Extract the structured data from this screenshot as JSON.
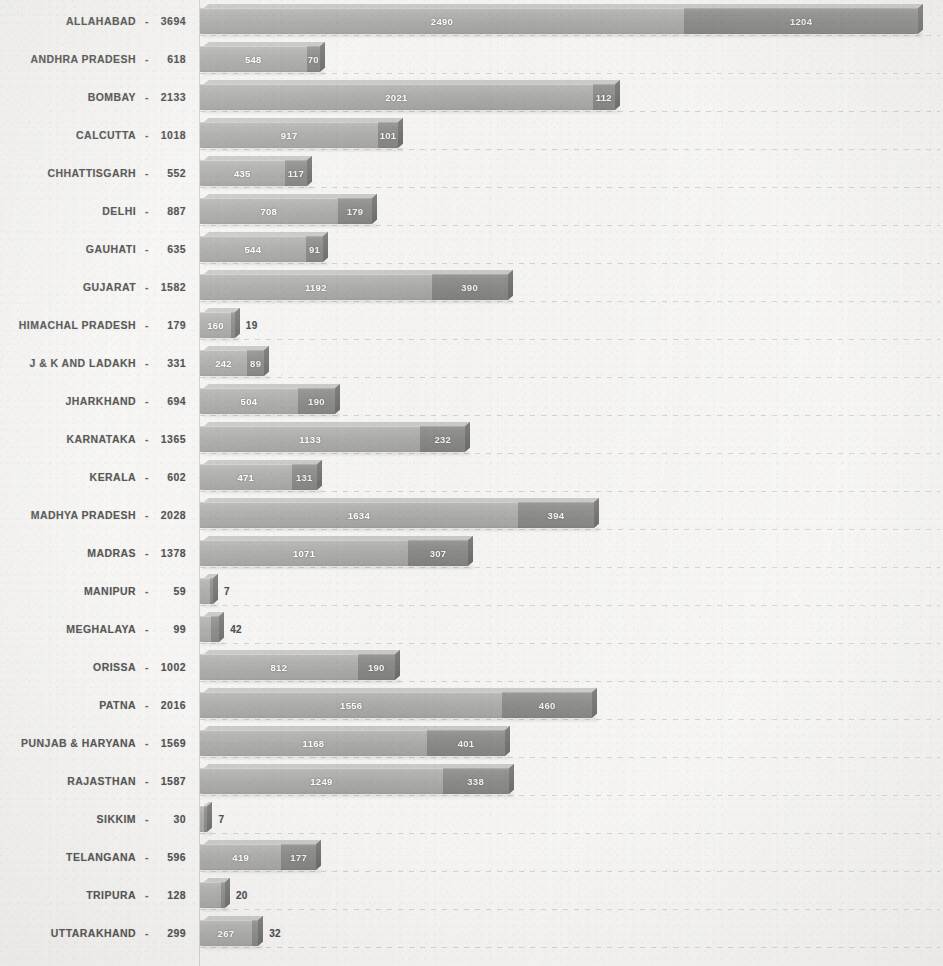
{
  "chart_data": {
    "type": "bar",
    "orientation": "horizontal",
    "stacked": true,
    "title": "",
    "subtitle": "",
    "xlabel": "",
    "ylabel": "",
    "grid": true,
    "legend": null,
    "xlim": [
      0,
      3800
    ],
    "x_axis_visible": false,
    "tick_labels": [],
    "series": [
      {
        "name": "segment-1",
        "color": "#a0a09e",
        "values": [
          2490,
          548,
          2021,
          917,
          435,
          708,
          544,
          1192,
          160,
          242,
          504,
          1133,
          471,
          1634,
          1071,
          52,
          57,
          812,
          1556,
          1168,
          1249,
          23,
          419,
          108,
          267
        ]
      },
      {
        "name": "segment-2",
        "color": "#7a7a78",
        "values": [
          1204,
          70,
          112,
          101,
          117,
          179,
          91,
          390,
          19,
          89,
          190,
          232,
          131,
          394,
          307,
          7,
          42,
          190,
          460,
          401,
          338,
          7,
          177,
          20,
          32
        ]
      }
    ],
    "categories": [
      "ALLAHABAD",
      "ANDHRA PRADESH",
      "BOMBAY",
      "CALCUTTA",
      "CHHATTISGARH",
      "DELHI",
      "GAUHATI",
      "GUJARAT",
      "HIMACHAL PRADESH",
      "J & K AND LADAKH",
      "JHARKHAND",
      "KARNATAKA",
      "KERALA",
      "MADHYA PRADESH",
      "MADRAS",
      "MANIPUR",
      "MEGHALAYA",
      "ORISSA",
      "PATNA",
      "PUNJAB & HARYANA",
      "RAJASTHAN",
      "SIKKIM",
      "TELANGANA",
      "TRIPURA",
      "UTTARAKHAND"
    ],
    "totals": [
      3694,
      618,
      2133,
      1018,
      552,
      887,
      635,
      1582,
      179,
      331,
      694,
      1365,
      602,
      2028,
      1378,
      59,
      99,
      1002,
      2016,
      1569,
      1587,
      30,
      596,
      128,
      299
    ]
  },
  "rows": [
    {
      "name": "ALLAHABAD",
      "separator": "-",
      "total": "3694",
      "v1": "2490",
      "v2": "1204",
      "n1": 2490,
      "n2": 1204,
      "inside2": true
    },
    {
      "name": "ANDHRA PRADESH",
      "separator": "-",
      "total": "618",
      "v1": "548",
      "v2": "70",
      "n1": 548,
      "n2": 70,
      "inside2": true
    },
    {
      "name": "BOMBAY",
      "separator": "-",
      "total": "2133",
      "v1": "2021",
      "v2": "112",
      "n1": 2021,
      "n2": 112,
      "inside2": true
    },
    {
      "name": "CALCUTTA",
      "separator": "-",
      "total": "1018",
      "v1": "917",
      "v2": "101",
      "n1": 917,
      "n2": 101,
      "inside2": true
    },
    {
      "name": "CHHATTISGARH",
      "separator": "-",
      "total": "552",
      "v1": "435",
      "v2": "117",
      "n1": 435,
      "n2": 117,
      "inside2": true
    },
    {
      "name": "DELHI",
      "separator": "-",
      "total": "887",
      "v1": "708",
      "v2": "179",
      "n1": 708,
      "n2": 179,
      "inside2": true
    },
    {
      "name": "GAUHATI",
      "separator": "-",
      "total": "635",
      "v1": "544",
      "v2": "91",
      "n1": 544,
      "n2": 91,
      "inside2": true
    },
    {
      "name": "GUJARAT",
      "separator": "-",
      "total": "1582",
      "v1": "1192",
      "v2": "390",
      "n1": 1192,
      "n2": 390,
      "inside2": true
    },
    {
      "name": "HIMACHAL PRADESH",
      "separator": "-",
      "total": "179",
      "v1": "160",
      "v2": "19",
      "n1": 160,
      "n2": 19,
      "inside2": false
    },
    {
      "name": "J & K AND LADAKH",
      "separator": "-",
      "total": "331",
      "v1": "242",
      "v2": "89",
      "n1": 242,
      "n2": 89,
      "inside2": true
    },
    {
      "name": "JHARKHAND",
      "separator": "-",
      "total": "694",
      "v1": "504",
      "v2": "190",
      "n1": 504,
      "n2": 190,
      "inside2": true
    },
    {
      "name": "KARNATAKA",
      "separator": "-",
      "total": "1365",
      "v1": "1133",
      "v2": "232",
      "n1": 1133,
      "n2": 232,
      "inside2": true
    },
    {
      "name": "KERALA",
      "separator": "-",
      "total": "602",
      "v1": "471",
      "v2": "131",
      "n1": 471,
      "n2": 131,
      "inside2": true
    },
    {
      "name": "MADHYA PRADESH",
      "separator": "-",
      "total": "2028",
      "v1": "1634",
      "v2": "394",
      "n1": 1634,
      "n2": 394,
      "inside2": true
    },
    {
      "name": "MADRAS",
      "separator": "-",
      "total": "1378",
      "v1": "1071",
      "v2": "307",
      "n1": 1071,
      "n2": 307,
      "inside2": true
    },
    {
      "name": "MANIPUR",
      "separator": "-",
      "total": "59",
      "v1": "52",
      "v2": "7",
      "n1": 52,
      "n2": 7,
      "inside2": false
    },
    {
      "name": "MEGHALAYA",
      "separator": "-",
      "total": "99",
      "v1": "57",
      "v2": "42",
      "n1": 57,
      "n2": 42,
      "inside2": false
    },
    {
      "name": "ORISSA",
      "separator": "-",
      "total": "1002",
      "v1": "812",
      "v2": "190",
      "n1": 812,
      "n2": 190,
      "inside2": true
    },
    {
      "name": "PATNA",
      "separator": "-",
      "total": "2016",
      "v1": "1556",
      "v2": "460",
      "n1": 1556,
      "n2": 460,
      "inside2": true
    },
    {
      "name": "PUNJAB & HARYANA",
      "separator": "-",
      "total": "1569",
      "v1": "1168",
      "v2": "401",
      "n1": 1168,
      "n2": 401,
      "inside2": true
    },
    {
      "name": "RAJASTHAN",
      "separator": "-",
      "total": "1587",
      "v1": "1249",
      "v2": "338",
      "n1": 1249,
      "n2": 338,
      "inside2": true
    },
    {
      "name": "SIKKIM",
      "separator": "-",
      "total": "30",
      "v1": "23",
      "v2": "7",
      "n1": 23,
      "n2": 7,
      "inside2": false
    },
    {
      "name": "TELANGANA",
      "separator": "-",
      "total": "596",
      "v1": "419",
      "v2": "177",
      "n1": 419,
      "n2": 177,
      "inside2": true
    },
    {
      "name": "TRIPURA",
      "separator": "-",
      "total": "128",
      "v1": "108",
      "v2": "20",
      "n1": 108,
      "n2": 20,
      "inside2": false
    },
    {
      "name": "UTTARAKHAND",
      "separator": "-",
      "total": "299",
      "v1": "267",
      "v2": "32",
      "n1": 267,
      "n2": 32,
      "inside2": false
    }
  ],
  "layout": {
    "plot_left_px": 200,
    "plot_width_px": 740,
    "row_height_px": 38,
    "row_top_px": 2,
    "bar_height_px": 26,
    "px_per_unit": 0.1944
  },
  "colors": {
    "segment_1": "#a0a09e",
    "segment_2": "#7a7a78",
    "background": "#f5f4f2",
    "label_text": "#2a2a2a",
    "gridline": "#6e6e6e"
  }
}
